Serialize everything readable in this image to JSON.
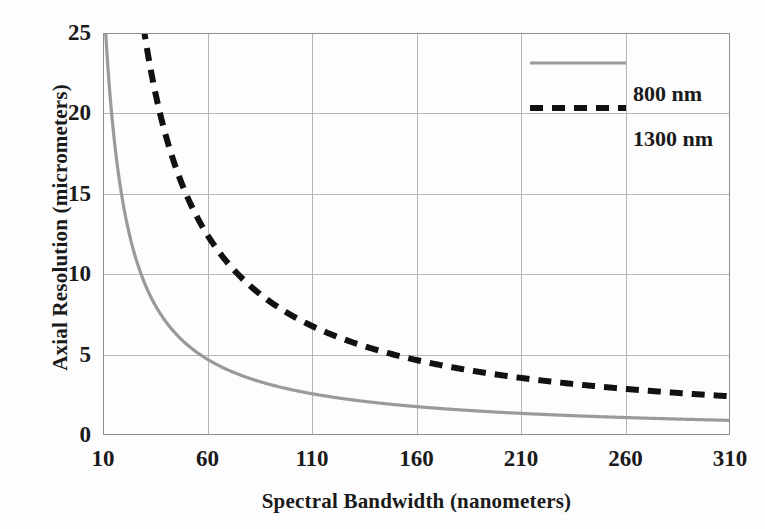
{
  "chart_data": {
    "type": "line",
    "title": "",
    "xlabel": "Spectral Bandwidth (nanometers)",
    "ylabel": "Axial Resolution (micrometers)",
    "xlim": [
      10,
      310
    ],
    "ylim": [
      0,
      25
    ],
    "xticks": [
      10,
      60,
      110,
      160,
      210,
      260,
      310
    ],
    "xtick_labels": [
      "10",
      "60",
      "110",
      "160",
      "210",
      "260",
      "310"
    ],
    "yticks": [
      0,
      5,
      10,
      15,
      20,
      25
    ],
    "ytick_labels": [
      "0",
      "5",
      "10",
      "15",
      "20",
      "25"
    ],
    "grid": true,
    "legend_position": "top-right",
    "relation": "axial resolution = (2*ln2/pi) * lambda^2 / bandwidth",
    "series": [
      {
        "name": "800 nm",
        "label": "800 nm",
        "color": "#9a9a9a",
        "style": "solid",
        "center_wavelength_nm": 800,
        "x": [
          10,
          15,
          20,
          25,
          30,
          35,
          40,
          45,
          50,
          55,
          60,
          70,
          80,
          90,
          100,
          110,
          120,
          135,
          150,
          160,
          175,
          185,
          200,
          210,
          225,
          235,
          250,
          260,
          275,
          285,
          300,
          310
        ],
        "values": [
          28.2,
          18.8,
          14.1,
          11.3,
          9.4,
          8.1,
          7.1,
          6.3,
          5.7,
          5.1,
          4.7,
          4.0,
          3.5,
          3.1,
          2.8,
          2.6,
          2.4,
          2.1,
          1.9,
          1.8,
          1.6,
          1.5,
          1.4,
          1.3,
          1.3,
          1.2,
          1.1,
          1.1,
          1.0,
          1.0,
          0.9,
          0.9
        ]
      },
      {
        "name": "1300 nm",
        "label": "1300 nm",
        "color": "#111111",
        "style": "dashed",
        "center_wavelength_nm": 1300,
        "x": [
          26,
          30,
          35,
          40,
          45,
          50,
          60,
          70,
          80,
          90,
          100,
          110,
          120,
          135,
          150,
          160,
          175,
          185,
          200,
          210,
          225,
          235,
          250,
          260,
          275,
          285,
          300,
          310
        ],
        "values": [
          25.0,
          21.7,
          18.6,
          16.3,
          14.5,
          13.0,
          10.9,
          9.3,
          8.1,
          7.2,
          6.5,
          5.9,
          5.4,
          4.8,
          4.3,
          4.1,
          3.7,
          3.5,
          3.3,
          3.1,
          2.9,
          2.8,
          2.6,
          2.5,
          2.4,
          2.3,
          2.2,
          2.1
        ]
      }
    ]
  },
  "legend": {
    "entries": [
      {
        "label": "800 nm",
        "color": "#9a9a9a",
        "style": "solid"
      },
      {
        "label": "1300 nm",
        "color": "#111111",
        "style": "dashed"
      }
    ]
  },
  "axes": {
    "x_title": "Spectral Bandwidth (nanometers)",
    "y_title": "Axial Resolution (micrometers)"
  }
}
